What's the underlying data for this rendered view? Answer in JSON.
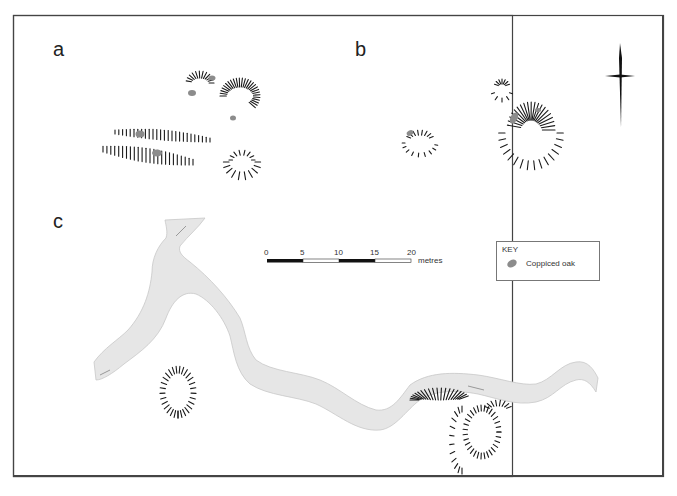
{
  "figure": {
    "panels": [
      {
        "id": "a",
        "label": "a"
      },
      {
        "id": "b",
        "label": "b"
      },
      {
        "id": "c",
        "label": "c"
      }
    ],
    "scale_bar": {
      "ticks": [
        "0",
        "5",
        "10",
        "15",
        "20"
      ],
      "unit": "metres"
    },
    "key": {
      "title": "KEY",
      "items": [
        {
          "symbol": "coppiced-oak-swatch",
          "label": "Coppiced oak"
        }
      ]
    },
    "north_arrow": {
      "direction": "north"
    },
    "colors": {
      "frame": "#444444",
      "hachure": "#1a1a1a",
      "river_fill": "#e6e6e6",
      "river_edge": "#c8c8c8",
      "oak": "#8c8c8c"
    }
  }
}
